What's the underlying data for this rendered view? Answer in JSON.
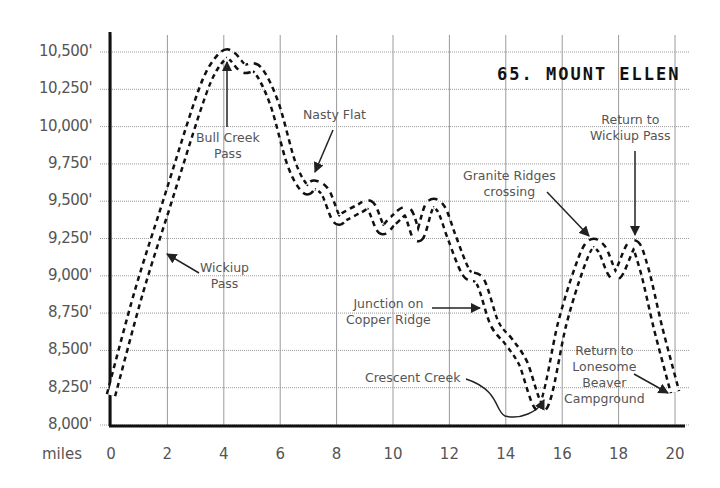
{
  "chart_data": {
    "type": "line",
    "title": "65. MOUNT ELLEN",
    "xlabel": "miles",
    "ylabel": "",
    "xlim": [
      0,
      20
    ],
    "ylim": [
      8000,
      10500
    ],
    "grid": true,
    "x_ticks": [
      "0",
      "2",
      "4",
      "6",
      "8",
      "10",
      "12",
      "14",
      "16",
      "18",
      "20"
    ],
    "y_ticks": [
      "8,000'",
      "8,250'",
      "8,500'",
      "8,750'",
      "9,000'",
      "9,250'",
      "9,500'",
      "9,750'",
      "10,000'",
      "10,250'",
      "10,500'"
    ],
    "series": [
      {
        "name": "Elevation profile",
        "x": [
          0,
          1,
          2,
          3,
          3.5,
          4,
          4.3,
          4.7,
          5.2,
          5.8,
          6.4,
          6.9,
          7.2,
          7.6,
          8,
          8.3,
          8.8,
          9.2,
          9.6,
          10.0,
          10.5,
          10.9,
          11.3,
          11.7,
          12.1,
          12.6,
          13.1,
          13.6,
          14.1,
          14.6,
          15.3,
          16.0,
          16.6,
          17.0,
          17.4,
          17.9,
          18.5,
          18.9,
          19.4,
          20.0
        ],
        "y": [
          8200,
          8900,
          9500,
          10100,
          10350,
          10480,
          10470,
          10390,
          10380,
          10150,
          9750,
          9580,
          9610,
          9560,
          9380,
          9400,
          9450,
          9470,
          9310,
          9370,
          9430,
          9260,
          9470,
          9450,
          9250,
          9020,
          8960,
          8680,
          8560,
          8420,
          8120,
          8680,
          9050,
          9210,
          9180,
          9000,
          9210,
          9050,
          8650,
          8220
        ]
      }
    ],
    "annotations": [
      {
        "text": "Bull Creek\nPass",
        "x": 4,
        "y": 10460
      },
      {
        "text": "Nasty Flat",
        "x": 7.0,
        "y": 9580
      },
      {
        "text": "Wickiup\nPass",
        "x": 1.8,
        "y": 9170
      },
      {
        "text": "Granite Ridges\ncrossing",
        "x": 17.0,
        "y": 9210
      },
      {
        "text": "Return to\nWickiup Pass",
        "x": 18.6,
        "y": 9210
      },
      {
        "text": "Junction on\nCopper Ridge",
        "x": 13.1,
        "y": 8800
      },
      {
        "text": "Crescent Creek",
        "x": 15.2,
        "y": 8120
      },
      {
        "text": "Return to\nLonesome\nBeaver\nCampground",
        "x": 19.8,
        "y": 8190
      }
    ]
  },
  "labels": {
    "title": "65. MOUNT ELLEN",
    "x_unit": "miles",
    "ann_bull_creek": "Bull Creek\nPass",
    "ann_nasty_flat": "Nasty Flat",
    "ann_wickiup": "Wickiup\nPass",
    "ann_granite": "Granite Ridges\ncrossing",
    "ann_return_wickiup": "Return to\nWickiup Pass",
    "ann_junction": "Junction on\nCopper Ridge",
    "ann_crescent": "Crescent Creek",
    "ann_return_lonesome": "Return to\nLonesome\nBeaver\nCampground"
  }
}
